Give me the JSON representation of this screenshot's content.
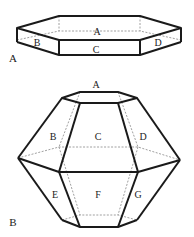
{
  "figures": [
    {
      "id": "A",
      "label": "A",
      "description": "flat hexagonal prism",
      "face_labels": {
        "top": "A",
        "left": "B",
        "front": "C",
        "right": "D"
      }
    },
    {
      "id": "B",
      "label": "B",
      "description": "hexagonal bipyramid truncated",
      "face_labels": {
        "top": "A",
        "upper_left": "B",
        "upper_front": "C",
        "upper_right": "D",
        "lower_left": "E",
        "lower_front": "F",
        "lower_right": "G"
      }
    }
  ]
}
